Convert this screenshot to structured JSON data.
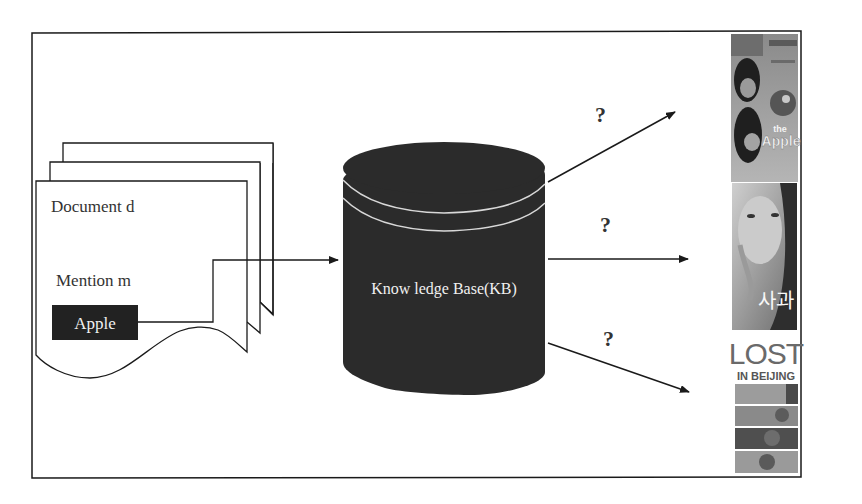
{
  "diagram": {
    "document": {
      "label": "Document d",
      "mention_label": "Mention m",
      "mention_value": "Apple"
    },
    "knowledge_base": {
      "label": "Know ledge Base(KB)"
    },
    "links": [
      {
        "label": "?",
        "direction": "up"
      },
      {
        "label": "?",
        "direction": "straight"
      },
      {
        "label": "?",
        "direction": "down"
      }
    ],
    "candidates": [
      {
        "name": "the Apple",
        "poster_title": "the",
        "poster_subtitle": "Apple"
      },
      {
        "name": "사과",
        "poster_title": "사과"
      },
      {
        "name": "Lost in Beijing",
        "poster_title": "LOST",
        "poster_subtitle": "IN BEIJING"
      }
    ],
    "colors": {
      "frame": "#1a1a1a",
      "cylinder": "#2b2b2b",
      "cylinder_band": "#d8d8d8",
      "mention_box": "#222222",
      "text_light": "#f0f0f0"
    }
  }
}
